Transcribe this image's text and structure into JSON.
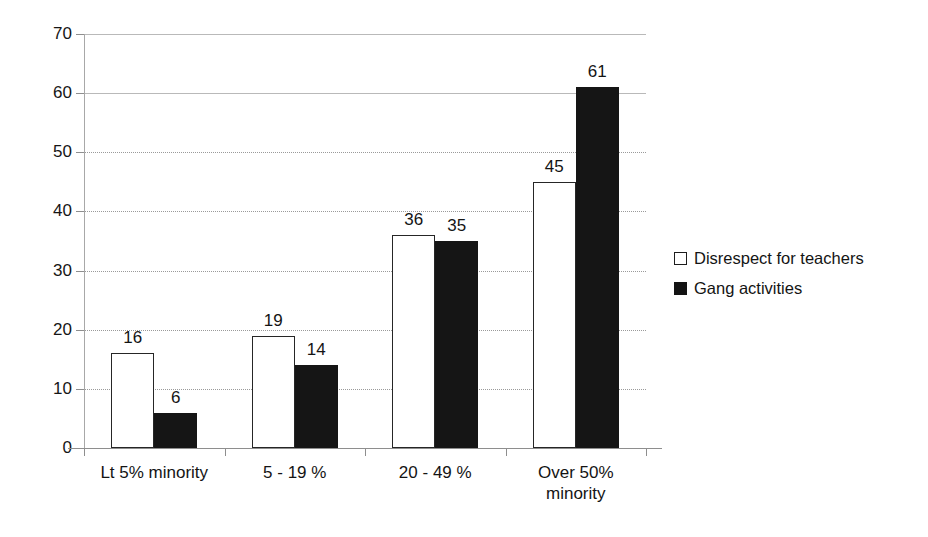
{
  "chart_data": {
    "type": "bar",
    "title": "",
    "subtitle": "",
    "xlabel": "",
    "ylabel": "",
    "ylim": [
      0,
      70
    ],
    "ytick_step": 10,
    "yticks": [
      "0",
      "10",
      "20",
      "30",
      "40",
      "50",
      "60",
      "70"
    ],
    "grid": true,
    "grid_axis": "y",
    "legend_position": "right",
    "categories": [
      "Lt 5% minority",
      "5 - 19 %",
      "20 - 49 %",
      "Over 50% minority"
    ],
    "category_lines": [
      [
        "Lt 5% minority"
      ],
      [
        "5 - 19 %"
      ],
      [
        "20 - 49 %"
      ],
      [
        "Over 50%",
        "minority"
      ]
    ],
    "series": [
      {
        "name": "Disrespect for teachers",
        "values": [
          16,
          19,
          36,
          45
        ],
        "fill": "#ffffff",
        "edge": "#262626",
        "swatch": "light"
      },
      {
        "name": "Gang activities",
        "values": [
          6,
          14,
          35,
          61
        ],
        "fill": "#151515",
        "edge": "#151515",
        "swatch": "dark"
      }
    ],
    "data_labels": [
      [
        "16",
        "6"
      ],
      [
        "19",
        "14"
      ],
      [
        "36",
        "35"
      ],
      [
        "45",
        "61"
      ]
    ]
  },
  "legend": {
    "items": [
      {
        "label": "Disrespect for teachers",
        "swatch": "light",
        "marker": "open-square-marker"
      },
      {
        "label": "Gang activities",
        "swatch": "dark",
        "marker": "filled-square-marker"
      }
    ]
  },
  "axes": {
    "y_axis_name": "value-axis",
    "x_axis_name": "category-axis"
  }
}
